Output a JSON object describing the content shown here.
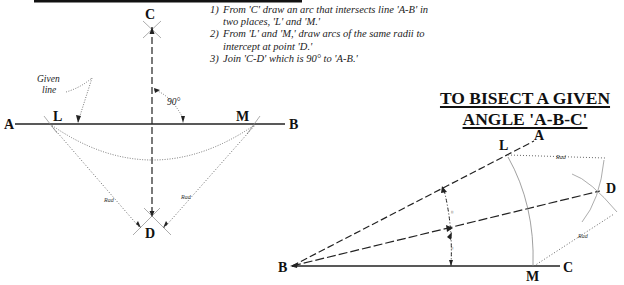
{
  "perpendicular": {
    "steps": [
      {
        "num": "1)",
        "text": "From 'C' draw an arc that intersects line 'A-B' in two places, 'L' and 'M.'"
      },
      {
        "num": "2)",
        "text": "From 'L' and 'M,' draw arcs of the same radii to intercept at point 'D.'"
      },
      {
        "num": "3)",
        "text": "Join 'C-D' which is 90° to 'A-B.'"
      }
    ],
    "labels": {
      "C": "C",
      "A": "A",
      "B": "B",
      "L": "L",
      "M": "M",
      "D": "D"
    },
    "given_line_label": [
      "Given",
      "line"
    ],
    "angle_label": "90°",
    "radius_label": "Rad"
  },
  "bisect": {
    "title_line1": "TO BISECT A GIVEN",
    "title_line2": "ANGLE 'A-B-C'",
    "labels": {
      "A": "A",
      "B": "B",
      "C": "C",
      "L": "L",
      "M": "M",
      "D": "D"
    },
    "equal_mark": "=",
    "radius_label": "Rad"
  }
}
